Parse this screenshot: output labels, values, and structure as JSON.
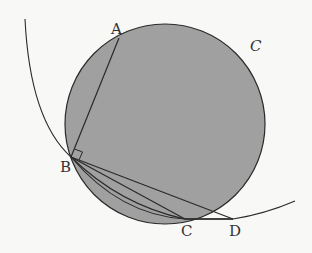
{
  "diagram": {
    "labels": {
      "A": "A",
      "B": "B",
      "C": "C",
      "D": "D",
      "circle": "C"
    },
    "colors": {
      "circle_fill": "#a0a0a0",
      "stroke": "#2a2a2a",
      "background": "#f8f8f6"
    },
    "elements": [
      "shaded circle C",
      "large arc through B, C, D",
      "segment AB",
      "segment BC",
      "segment BD",
      "arc BC",
      "right-angle mark at B"
    ]
  }
}
